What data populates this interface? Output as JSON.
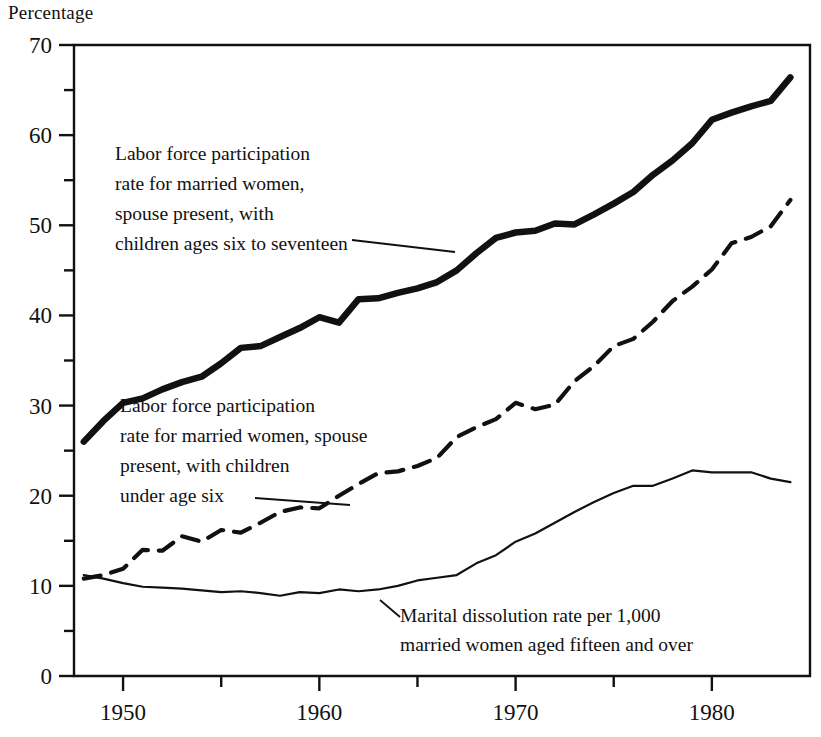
{
  "axis_title": "Percentage",
  "chart_data": {
    "type": "line",
    "title": "",
    "subtitle": "",
    "xlabel": "",
    "ylabel": "Percentage",
    "xlim": [
      1947.5,
      1985
    ],
    "ylim": [
      0,
      70
    ],
    "grid": false,
    "legend_position": "inline-annotations",
    "yticks": [
      0,
      10,
      20,
      30,
      40,
      50,
      60,
      70
    ],
    "ytick_labels": [
      "0",
      "10",
      "20",
      "30",
      "40",
      "50",
      "60",
      "70"
    ],
    "yminor_ticks": [
      5,
      15,
      25,
      35,
      45,
      55,
      65
    ],
    "xticks": [
      1950,
      1960,
      1970,
      1980
    ],
    "xtick_labels": [
      "1950",
      "1960",
      "1970",
      "1980"
    ],
    "xminor_ticks": [
      1955,
      1965,
      1975
    ],
    "x": [
      1948,
      1949,
      1950,
      1951,
      1952,
      1953,
      1954,
      1955,
      1956,
      1957,
      1958,
      1959,
      1960,
      1961,
      1962,
      1963,
      1964,
      1965,
      1966,
      1967,
      1968,
      1969,
      1970,
      1971,
      1972,
      1973,
      1974,
      1975,
      1976,
      1977,
      1978,
      1979,
      1980,
      1981,
      1982,
      1983,
      1984
    ],
    "series": [
      {
        "name": "Labor force participation rate for married women, spouse present, with children ages six to seventeen",
        "style": "thick-solid",
        "values": [
          26.0,
          28.3,
          30.3,
          30.8,
          31.8,
          32.6,
          33.2,
          34.7,
          36.4,
          36.6,
          37.6,
          38.6,
          39.8,
          39.2,
          41.8,
          41.9,
          42.5,
          43.0,
          43.7,
          45.0,
          46.9,
          48.6,
          49.2,
          49.4,
          50.2,
          50.1,
          51.2,
          52.4,
          53.7,
          55.6,
          57.2,
          59.1,
          61.7,
          62.5,
          63.2,
          63.8,
          66.4
        ]
      },
      {
        "name": "Labor force participation rate for married women, spouse present, with children under age six",
        "style": "dashed",
        "values": [
          10.8,
          11.2,
          11.9,
          14.0,
          13.9,
          15.5,
          14.9,
          16.2,
          15.9,
          17.0,
          18.2,
          18.7,
          18.6,
          20.0,
          21.3,
          22.5,
          22.7,
          23.3,
          24.2,
          26.5,
          27.6,
          28.5,
          30.3,
          29.6,
          30.1,
          32.7,
          34.4,
          36.6,
          37.4,
          39.3,
          41.6,
          43.2,
          45.1,
          48.0,
          48.7,
          49.9,
          52.8
        ]
      },
      {
        "name": "Marital dissolution rate per 1,000 married women aged fifteen and over",
        "style": "thin-solid",
        "values": [
          11.2,
          10.8,
          10.3,
          9.9,
          9.8,
          9.7,
          9.5,
          9.3,
          9.4,
          9.2,
          8.9,
          9.3,
          9.2,
          9.6,
          9.4,
          9.6,
          10.0,
          10.6,
          10.9,
          11.2,
          12.5,
          13.4,
          14.9,
          15.8,
          17.0,
          18.2,
          19.3,
          20.3,
          21.1,
          21.1,
          21.9,
          22.8,
          22.6,
          22.6,
          22.6,
          21.9,
          21.5
        ]
      }
    ]
  },
  "annotations": [
    {
      "id": "annotation-thick-line",
      "lines": [
        "Labor force participation",
        "rate for married women,",
        "spouse present, with",
        "children ages six to seventeen"
      ]
    },
    {
      "id": "annotation-dashed-line",
      "lines": [
        "Labor force participation",
        "rate for married women, spouse",
        "present, with children",
        "under age six"
      ]
    },
    {
      "id": "annotation-thin-line",
      "lines": [
        "Marital dissolution rate per 1,000",
        "married women aged fifteen and over"
      ]
    }
  ],
  "colors": {
    "ink": "#111111",
    "background": "#ffffff"
  }
}
